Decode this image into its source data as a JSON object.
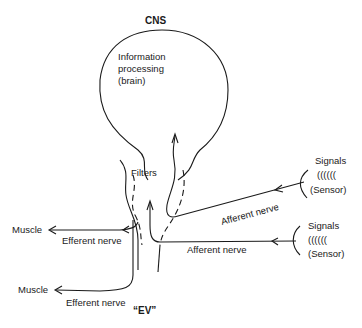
{
  "diagram": {
    "title": "CNS",
    "brain_label": [
      "Information",
      "processing",
      "(brain)"
    ],
    "filters_label": "Filters",
    "bottom_label": "“EV”",
    "sensors": [
      {
        "signals_label": "Signals",
        "waves": "((((((",
        "sensor_label": "(Sensor)"
      },
      {
        "signals_label": "Signals",
        "waves": "((((((",
        "sensor_label": "(Sensor)"
      }
    ],
    "afferent_nerves": [
      {
        "label": "Afferent nerve"
      },
      {
        "label": "Afferent nerve"
      }
    ],
    "efferent_nerves": [
      {
        "label": "Efferent nerve",
        "target": "Muscle"
      },
      {
        "label": "Efferent nerve",
        "target": "Muscle"
      }
    ]
  }
}
